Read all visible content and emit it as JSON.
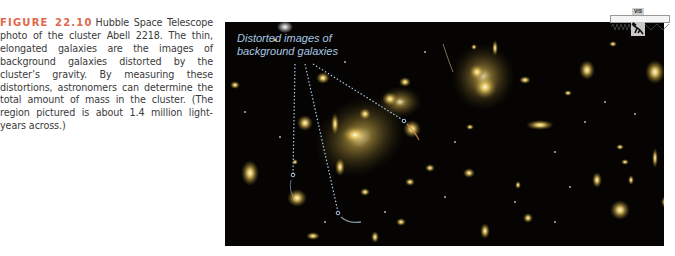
{
  "figure": {
    "label": "FIGURE 22.10",
    "caption": "Hubble Space Telescope photo of the cluster Abell 2218. The thin, elon­gated galaxies are the images of background galaxies distorted by the cluster’s gravity. By measuring these distortions, astronomers can determine the total amount of mass in the clus­ter. (The region pictured is about 1.4 million light-years across.)",
    "label_color": "#e2674a"
  },
  "photo": {
    "subject": "Galaxy cluster Abell 2218",
    "annotation_line1": "Distorted images of",
    "annotation_line2": "background galaxies",
    "annotation_color": "#a9c7e4",
    "background_color": "#050403"
  },
  "spectrum_icon": {
    "band_label": "VIS",
    "icon": "telescope-icon"
  }
}
